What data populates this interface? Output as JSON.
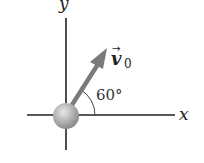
{
  "diagram": {
    "type": "projectile-launch-vector",
    "axes": {
      "x_label": "x",
      "y_label": "y"
    },
    "vector": {
      "label": "v",
      "subscript": "0",
      "angle_label": "60°",
      "angle_deg": 60
    },
    "colors": {
      "axis": "#222222",
      "arrow": "#7a7a7a",
      "ball": "#b5b5b5"
    }
  }
}
